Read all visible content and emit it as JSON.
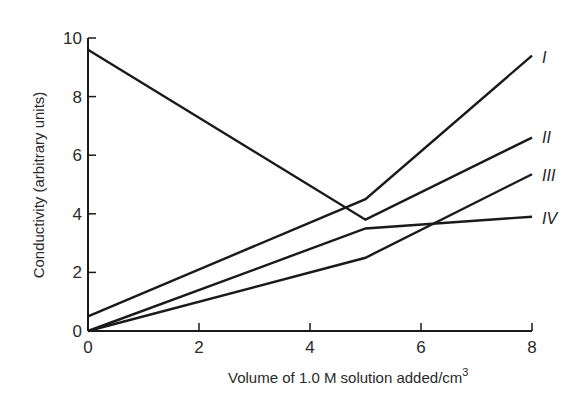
{
  "chart_data": {
    "type": "line",
    "title": "",
    "xlabel": "Volume of 1.0 M solution added/cm³",
    "ylabel": "Conductivity (arbitrary units)",
    "xlim": [
      0,
      8
    ],
    "ylim": [
      0,
      10
    ],
    "xticks": [
      0,
      2,
      4,
      6,
      8
    ],
    "yticks": [
      0,
      2,
      4,
      6,
      8,
      10
    ],
    "grid": false,
    "legend": "inline labels at right end of lines",
    "series": [
      {
        "name": "I",
        "x": [
          0,
          5,
          8
        ],
        "y": [
          0.5,
          4.5,
          9.4
        ]
      },
      {
        "name": "II",
        "x": [
          0,
          5,
          8
        ],
        "y": [
          9.6,
          3.8,
          6.6
        ]
      },
      {
        "name": "III",
        "x": [
          0,
          5,
          8
        ],
        "y": [
          0.0,
          2.5,
          5.35
        ]
      },
      {
        "name": "IV",
        "x": [
          0,
          5,
          8
        ],
        "y": [
          0.0,
          3.5,
          3.9
        ]
      }
    ]
  },
  "axes": {
    "x_tick_labels": [
      "0",
      "2",
      "4",
      "6",
      "8"
    ],
    "y_tick_labels": [
      "0",
      "2",
      "4",
      "6",
      "8",
      "10"
    ],
    "x_title_main": "Volume of 1.0 M solution added/cm",
    "x_title_sup": "3",
    "y_title": "Conductivity (arbitrary units)"
  },
  "colors": {
    "line": "#1a1a1a",
    "text": "#2a2a2a",
    "background": "#ffffff"
  }
}
